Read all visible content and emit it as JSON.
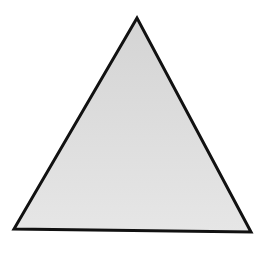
{
  "diagram": {
    "shape": "triangle",
    "kind": "equilateral-like",
    "background": "#ffffff",
    "fill": "#e0e0e0",
    "stroke": "#111111",
    "stroke_width": 3,
    "vertices": {
      "apex": [
        137,
        18
      ],
      "bottom_left": [
        14,
        229
      ],
      "bottom_right": [
        251,
        232
      ]
    }
  }
}
